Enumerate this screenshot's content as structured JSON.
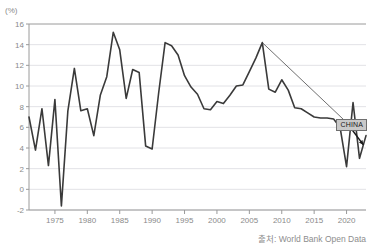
{
  "chart": {
    "unit_label": "(%)",
    "source_text": "출처: World Bank Open Data",
    "annotation_label": "CHINA"
  },
  "chart_data": {
    "type": "line",
    "title": "",
    "subtitle": "",
    "xlabel": "",
    "ylabel": "(%)",
    "ylim": [
      -2,
      16
    ],
    "xlim": [
      1971,
      2023
    ],
    "grid": true,
    "legend": "none",
    "yticks": [
      -2,
      0,
      2,
      4,
      6,
      8,
      10,
      12,
      14,
      16
    ],
    "xticks": [
      1975,
      1980,
      1985,
      1990,
      1995,
      2000,
      2005,
      2010,
      2015,
      2020
    ],
    "annotations": [
      {
        "text": "CHINA",
        "x": 2020.6,
        "y": 6.3,
        "type": "label-box",
        "leader_from": [
          2007,
          14.2
        ],
        "arrow_to": [
          2022.6,
          4.3
        ]
      }
    ],
    "series": [
      {
        "name": "China GDP growth",
        "color": "#3a3a3a",
        "x": [
          1971,
          1972,
          1973,
          1974,
          1975,
          1976,
          1977,
          1978,
          1979,
          1980,
          1981,
          1982,
          1983,
          1984,
          1985,
          1986,
          1987,
          1988,
          1989,
          1990,
          1991,
          1992,
          1993,
          1994,
          1995,
          1996,
          1997,
          1998,
          1999,
          2000,
          2001,
          2002,
          2003,
          2004,
          2005,
          2006,
          2007,
          2008,
          2009,
          2010,
          2011,
          2012,
          2013,
          2014,
          2015,
          2016,
          2017,
          2018,
          2019,
          2020,
          2021,
          2022,
          2023
        ],
        "values": [
          7.0,
          3.8,
          7.8,
          2.3,
          8.7,
          -1.6,
          7.6,
          11.7,
          7.6,
          7.8,
          5.2,
          9.1,
          10.9,
          15.2,
          13.5,
          8.8,
          11.6,
          11.3,
          4.2,
          3.9,
          9.3,
          14.2,
          13.9,
          13.0,
          11.0,
          9.9,
          9.2,
          7.8,
          7.7,
          8.5,
          8.3,
          9.1,
          10.0,
          10.1,
          11.4,
          12.7,
          14.2,
          9.7,
          9.4,
          10.6,
          9.6,
          7.9,
          7.8,
          7.4,
          7.0,
          6.9,
          6.9,
          6.8,
          6.0,
          2.2,
          8.4,
          3.0,
          5.2
        ]
      }
    ],
    "trend_line": {
      "name": "peak-to-present trend",
      "color": "#4a4a4a",
      "points": [
        [
          2007,
          14.2
        ],
        [
          2020.3,
          6.3
        ]
      ]
    }
  }
}
